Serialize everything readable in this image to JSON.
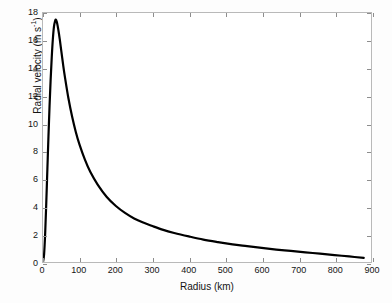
{
  "figure": {
    "background_color": "#fdfdfd",
    "plot_background_color": "#ffffff",
    "frame_color": "#b9b9b9",
    "line_color": "#000000"
  },
  "axis_labels": {
    "x": "Radius (km)",
    "y_main": "Radial velocity (m s",
    "y_exponent": "-1",
    "y_close": ")"
  },
  "chart_data": {
    "type": "line",
    "title": "",
    "subtitle": "",
    "xlabel": "Radius (km)",
    "ylabel": "Radial velocity (m s^-1)",
    "xlim": [
      0,
      900
    ],
    "ylim": [
      0,
      18
    ],
    "xticks": [
      0,
      100,
      200,
      300,
      400,
      500,
      600,
      700,
      800,
      900
    ],
    "xtick_labels": [
      "0",
      "100",
      "200",
      "300",
      "400",
      "500",
      "600",
      "700",
      "800",
      "900"
    ],
    "yticks": [
      0,
      2,
      4,
      6,
      8,
      10,
      12,
      14,
      16,
      18
    ],
    "ytick_labels": [
      "0",
      "2",
      "4",
      "6",
      "8",
      "10",
      "12",
      "14",
      "16",
      "18"
    ],
    "grid": false,
    "legend": null,
    "legend_position": "none",
    "annotations": [],
    "series": [
      {
        "name": "Radial velocity profile",
        "color": "#000000",
        "line_width": 2.2,
        "x": [
          0,
          3,
          6,
          9,
          12,
          15,
          18,
          21,
          24,
          27,
          30,
          33,
          35,
          38,
          42,
          46,
          50,
          55,
          60,
          70,
          80,
          90,
          100,
          115,
          130,
          150,
          175,
          200,
          225,
          250,
          275,
          300,
          330,
          360,
          400,
          440,
          480,
          520,
          560,
          600,
          640,
          680,
          720,
          760,
          800,
          840,
          880
        ],
        "y": [
          0.0,
          0.55,
          2.1,
          4.3,
          6.7,
          9.1,
          11.3,
          13.2,
          14.8,
          16.1,
          17.0,
          17.4,
          17.52,
          17.35,
          16.8,
          16.1,
          15.3,
          14.3,
          13.4,
          11.8,
          10.5,
          9.4,
          8.5,
          7.4,
          6.5,
          5.6,
          4.7,
          4.05,
          3.55,
          3.15,
          2.85,
          2.6,
          2.32,
          2.1,
          1.85,
          1.62,
          1.44,
          1.28,
          1.15,
          1.02,
          0.9,
          0.8,
          0.7,
          0.6,
          0.5,
          0.4,
          0.3
        ],
        "peak": {
          "x": 35,
          "y": 17.5
        }
      }
    ]
  }
}
